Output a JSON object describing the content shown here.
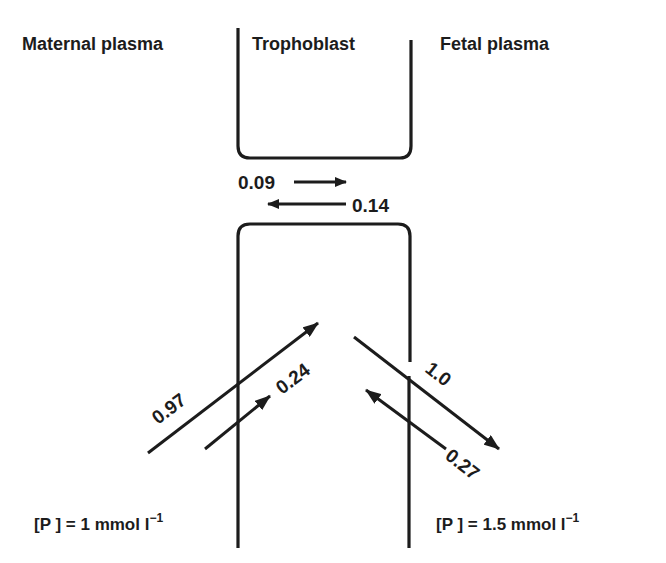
{
  "regions": {
    "maternal": "Maternal plasma",
    "trophoblast": "Trophoblast",
    "fetal": "Fetal plasma"
  },
  "fluxes": {
    "paracellular_m_to_f": "0.09",
    "paracellular_f_to_m": "0.14",
    "maternal_influx": "0.97",
    "maternal_efflux": "0.24",
    "fetal_efflux": "1.0",
    "fetal_influx": "0.27"
  },
  "concentrations": {
    "maternal": "[P ] = 1 mmol l",
    "maternal_exp": "−1",
    "fetal": "[P ] = 1.5 mmol  l",
    "fetal_exp": "−1"
  },
  "colors": {
    "ink": "#1c1c1c",
    "background": "#ffffff"
  }
}
